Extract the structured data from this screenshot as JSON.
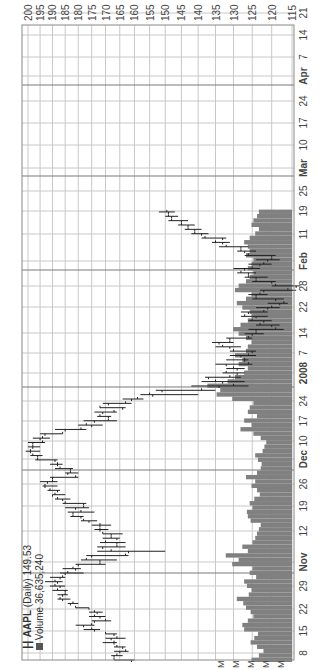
{
  "header": {
    "symbol": "AAPL",
    "interval": "(Daily)",
    "last_price": "149.53",
    "volume_label": "Volume",
    "volume_value": "36,635,240"
  },
  "colors": {
    "grid": "#c8c8c8",
    "month_separator": "#7a7a7a",
    "price_bar": "#222222",
    "volume_bar": "#808080",
    "axis_text": "#444444"
  },
  "chart_data": {
    "type": "ohlc_with_volume",
    "title": "AAPL (Daily) 149.53",
    "subtitle": "Volume 36,635,240",
    "ylabel": "Price",
    "yscale": "log",
    "ylim": [
      115,
      200
    ],
    "y_ticks": [
      200,
      195,
      190,
      185,
      180,
      175,
      170,
      165,
      160,
      155,
      150,
      145,
      140,
      135,
      130,
      125,
      120,
      115
    ],
    "x_tick_labels": [
      {
        "label": "8",
        "x": 17,
        "bold": false
      },
      {
        "label": "15",
        "x": 39,
        "bold": false
      },
      {
        "label": "22",
        "x": 61,
        "bold": false
      },
      {
        "label": "29",
        "x": 84,
        "bold": false
      },
      {
        "label": "Nov",
        "x": 108,
        "bold": true
      },
      {
        "label": "12",
        "x": 139,
        "bold": false
      },
      {
        "label": "19",
        "x": 164,
        "bold": false
      },
      {
        "label": "26",
        "x": 186,
        "bold": false
      },
      {
        "label": "Dec",
        "x": 211,
        "bold": true
      },
      {
        "label": "10",
        "x": 229,
        "bold": false
      },
      {
        "label": "17",
        "x": 249,
        "bold": false
      },
      {
        "label": "24",
        "x": 269,
        "bold": false
      },
      {
        "label": "2008",
        "x": 297,
        "bold": true
      },
      {
        "label": "7",
        "x": 317,
        "bold": false
      },
      {
        "label": "14",
        "x": 337,
        "bold": false
      },
      {
        "label": "22",
        "x": 363,
        "bold": false
      },
      {
        "label": "28",
        "x": 384,
        "bold": false
      },
      {
        "label": "Feb",
        "x": 409,
        "bold": true
      },
      {
        "label": "11",
        "x": 436,
        "bold": false
      },
      {
        "label": "19",
        "x": 459,
        "bold": false
      },
      {
        "label": "25",
        "x": 479,
        "bold": false
      },
      {
        "label": "Mar",
        "x": 502,
        "bold": true
      },
      {
        "label": "10",
        "x": 525,
        "bold": false
      },
      {
        "label": "17",
        "x": 547,
        "bold": false
      },
      {
        "label": "24",
        "x": 569,
        "bold": false
      },
      {
        "label": "Apr",
        "x": 594,
        "bold": true
      },
      {
        "label": "7",
        "x": 613,
        "bold": false
      },
      {
        "label": "14",
        "x": 635,
        "bold": false
      },
      {
        "label": "21",
        "x": 657,
        "bold": false
      }
    ],
    "month_separators_x": [
      97,
      200,
      283,
      400,
      494,
      585
    ],
    "volume_axis_labels": [
      "M",
      "M",
      "M",
      "M",
      "M"
    ],
    "series": [
      {
        "name": "AAPL daily OHLC (approx.)",
        "start_x": 10,
        "step_x": 4.35,
        "ohlc": [
          [
            161,
            167,
            160,
            167
          ],
          [
            167,
            168,
            164,
            166
          ],
          [
            165,
            167,
            162,
            163
          ],
          [
            164,
            167,
            163,
            166
          ],
          [
            167,
            171,
            166,
            167
          ],
          [
            168,
            170,
            163,
            166
          ],
          [
            167,
            170,
            166,
            170
          ],
          [
            174,
            178,
            172,
            175
          ],
          [
            178,
            181,
            174,
            175
          ],
          [
            174,
            175,
            168,
            170
          ],
          [
            172,
            176,
            170,
            174
          ],
          [
            173,
            176,
            171,
            174
          ],
          [
            176,
            181,
            176,
            181
          ],
          [
            183,
            184,
            180,
            182
          ],
          [
            186,
            188,
            183,
            187
          ],
          [
            186,
            188,
            184,
            185
          ],
          [
            185,
            190,
            184,
            188
          ],
          [
            187,
            191,
            185,
            189
          ],
          [
            188,
            193,
            186,
            189
          ],
          [
            187,
            191,
            185,
            186
          ],
          [
            185,
            187,
            178,
            184
          ],
          [
            181,
            186,
            179,
            182
          ],
          [
            180,
            181,
            170,
            172
          ],
          [
            172,
            179,
            166,
            177
          ],
          [
            175,
            177,
            162,
            163
          ],
          [
            162,
            173,
            150,
            168
          ],
          [
            171,
            173,
            163,
            166
          ],
          [
            166,
            172,
            163,
            170
          ],
          [
            166,
            171,
            165,
            168
          ],
          [
            168,
            171,
            164,
            171
          ],
          [
            172,
            174,
            169,
            172
          ],
          [
            172,
            175,
            168,
            172
          ],
          [
            176,
            179,
            173,
            178
          ],
          [
            179,
            183,
            178,
            182
          ],
          [
            182,
            184,
            174,
            179
          ],
          [
            181,
            185,
            176,
            178
          ],
          [
            178,
            186,
            177,
            185
          ],
          [
            186,
            189,
            183,
            188
          ],
          [
            190,
            190,
            185,
            189
          ],
          [
            188,
            192,
            187,
            191
          ],
          [
            193,
            194,
            188,
            193
          ],
          [
            192,
            195,
            188,
            190
          ],
          [
            190,
            191,
            180,
            181
          ],
          [
            184,
            185,
            180,
            183
          ],
          [
            183,
            189,
            182,
            187
          ],
          [
            188,
            191,
            186,
            188
          ],
          [
            189,
            197,
            188,
            196
          ],
          [
            196,
            199,
            194,
            198
          ],
          [
            199,
            201,
            195,
            199
          ],
          [
            198,
            200,
            195,
            198
          ],
          [
            198,
            200,
            193,
            194
          ],
          [
            195,
            198,
            191,
            194
          ],
          [
            193,
            195,
            186,
            186
          ],
          [
            185,
            189,
            177,
            179
          ],
          [
            175,
            180,
            171,
            177
          ],
          [
            174,
            178,
            166,
            169
          ],
          [
            169,
            173,
            168,
            172
          ],
          [
            171,
            174,
            166,
            167
          ],
          [
            164,
            172,
            163,
            172
          ],
          [
            169,
            171,
            161,
            163
          ],
          [
            161,
            164,
            157,
            159
          ],
          [
            154,
            158,
            140,
            155
          ],
          [
            151,
            153,
            135,
            139
          ],
          [
            134,
            142,
            126,
            130
          ],
          [
            133,
            139,
            127,
            135
          ],
          [
            137,
            138,
            128,
            131
          ],
          [
            129,
            133,
            127,
            132
          ],
          [
            129,
            132,
            127,
            130
          ],
          [
            132,
            135,
            125,
            126
          ],
          [
            127,
            132,
            126,
            127
          ],
          [
            128,
            131,
            124,
            126
          ],
          [
            125,
            131,
            124,
            130
          ],
          [
            131,
            135,
            128,
            133
          ],
          [
            134,
            136,
            130,
            131
          ],
          [
            131,
            132,
            125,
            126
          ],
          [
            125,
            127,
            122,
            124
          ],
          [
            124,
            126,
            117,
            119
          ],
          [
            120,
            124,
            118,
            123
          ],
          [
            122,
            126,
            120,
            125
          ],
          [
            124,
            128,
            121,
            127
          ],
          [
            126,
            128,
            121,
            122
          ],
          [
            121,
            124,
            118,
            120
          ],
          [
            118,
            121,
            116,
            117
          ],
          [
            119,
            125,
            117,
            124
          ],
          [
            124,
            126,
            121,
            123
          ],
          [
            122,
            123,
            114,
            116
          ],
          [
            114,
            120,
            113,
            119
          ],
          [
            120,
            125,
            119,
            124
          ],
          [
            124,
            127,
            121,
            126
          ],
          [
            126,
            129,
            124,
            128
          ],
          [
            127,
            130,
            123,
            125
          ],
          [
            123,
            126,
            120,
            122
          ],
          [
            121,
            124,
            118,
            120
          ],
          [
            120,
            127,
            119,
            126
          ],
          [
            127,
            129,
            124,
            128
          ],
          [
            128,
            134,
            126,
            132
          ],
          [
            133,
            136,
            131,
            135
          ],
          [
            133,
            139,
            132,
            138
          ],
          [
            139,
            142,
            137,
            141
          ],
          [
            141,
            144,
            139,
            143
          ],
          [
            143,
            146,
            141,
            145
          ],
          [
            145,
            149,
            143,
            148
          ],
          [
            148,
            150,
            146,
            149
          ],
          [
            149,
            152,
            147,
            149.53
          ]
        ],
        "volume_m": [
          44,
          36,
          31,
          38,
          45,
          41,
          37,
          52,
          54,
          48,
          42,
          45,
          50,
          53,
          60,
          47,
          44,
          49,
          52,
          39,
          46,
          43,
          65,
          58,
          72,
          48,
          54,
          43,
          40,
          38,
          36,
          34,
          45,
          48,
          49,
          43,
          46,
          41,
          35,
          38,
          44,
          40,
          50,
          38,
          34,
          33,
          37,
          40,
          32,
          30,
          28,
          34,
          42,
          56,
          44,
          52,
          38,
          48,
          46,
          42,
          65,
          82,
          78,
          92,
          70,
          62,
          52,
          48,
          58,
          54,
          62,
          50,
          48,
          44,
          50,
          58,
          64,
          56,
          48,
          44,
          46,
          54,
          60,
          50,
          44,
          62,
          58,
          50,
          46,
          42,
          48,
          44,
          42,
          50,
          46,
          48,
          52,
          46,
          40,
          36,
          44,
          42,
          38,
          36
        ]
      }
    ]
  }
}
